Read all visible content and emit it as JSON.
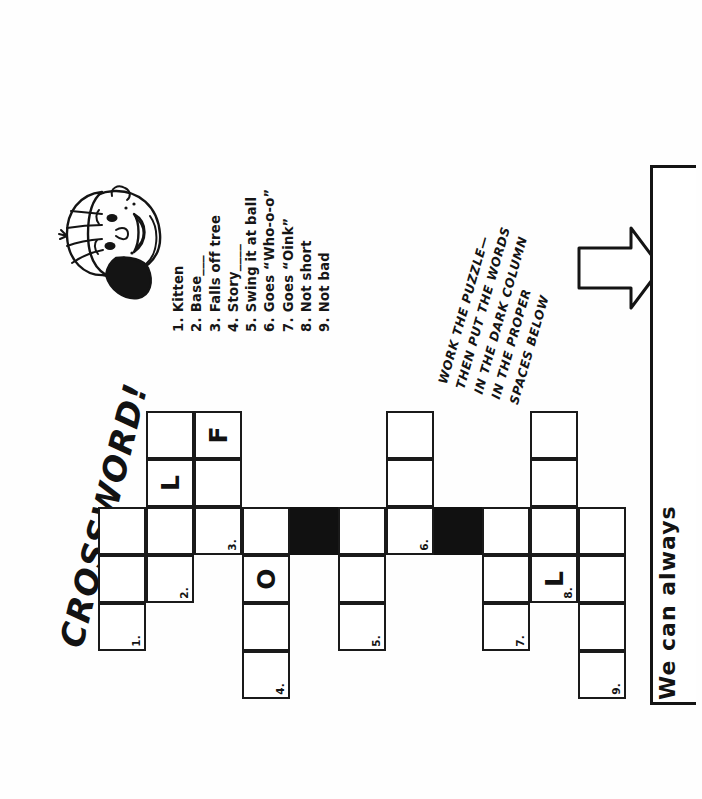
{
  "page": {
    "title": "CROSSWORD!",
    "orientation": "rotated-90-ccw",
    "background_color": "#ffffff",
    "ink_color": "#141414"
  },
  "mascot": {
    "name": "boy-wearing-baseball-cap",
    "description": "cartoon face of a smiling boy wearing a striped baseball cap"
  },
  "clues": {
    "items": [
      {
        "num": "1.",
        "text": "Kitten"
      },
      {
        "num": "2.",
        "text": "Base___"
      },
      {
        "num": "3.",
        "text": "Falls off tree"
      },
      {
        "num": "4.",
        "text": "Story____"
      },
      {
        "num": "5.",
        "text": "Swing it at ball"
      },
      {
        "num": "6.",
        "text": "Goes “Who-o-o”"
      },
      {
        "num": "7.",
        "text": "Goes “Oink”"
      },
      {
        "num": "8.",
        "text": "Not short"
      },
      {
        "num": "9.",
        "text": "Not bad"
      }
    ]
  },
  "instructions": {
    "lines": [
      "WORK THE PUZZLE—",
      "THEN PUT THE WORDS",
      "IN THE DARK COLUMN",
      "IN THE PROPER",
      "SPACES BELOW"
    ]
  },
  "arrow": {
    "name": "right-pointing-arrow",
    "direction": "right"
  },
  "answer_area": {
    "prompt": "We can always",
    "blank_line_value": ""
  },
  "chart_data": {
    "type": "table",
    "note": "Grid drawn in the rotated coordinate frame of the scan. Rows/cols here are given as on-screen pixel boxes.",
    "dark_row": {
      "label": "dark column (highlighted answer strip)",
      "color": "#111111"
    },
    "prefilled_letters": [
      {
        "clue": "3",
        "letter": "F"
      },
      {
        "clue": "3",
        "letter": "L"
      },
      {
        "clue": "4",
        "letter": "O"
      },
      {
        "clue": "8",
        "letter": "L"
      }
    ],
    "cells": [
      {
        "x": 98,
        "y": 507,
        "w": 48,
        "h": 48,
        "dark": false,
        "num": "",
        "letter": ""
      },
      {
        "x": 146,
        "y": 507,
        "w": 48,
        "h": 48,
        "dark": false,
        "num": "",
        "letter": ""
      },
      {
        "x": 194,
        "y": 507,
        "w": 48,
        "h": 48,
        "dark": false,
        "num": "3.",
        "letter": ""
      },
      {
        "x": 242,
        "y": 507,
        "w": 48,
        "h": 48,
        "dark": false,
        "num": "",
        "letter": ""
      },
      {
        "x": 290,
        "y": 507,
        "w": 48,
        "h": 48,
        "dark": true,
        "num": "",
        "letter": ""
      },
      {
        "x": 338,
        "y": 507,
        "w": 48,
        "h": 48,
        "dark": false,
        "num": "",
        "letter": ""
      },
      {
        "x": 386,
        "y": 507,
        "w": 48,
        "h": 48,
        "dark": false,
        "num": "6.",
        "letter": ""
      },
      {
        "x": 434,
        "y": 507,
        "w": 48,
        "h": 48,
        "dark": true,
        "num": "",
        "letter": ""
      },
      {
        "x": 482,
        "y": 507,
        "w": 48,
        "h": 48,
        "dark": false,
        "num": "",
        "letter": ""
      },
      {
        "x": 530,
        "y": 507,
        "w": 48,
        "h": 48,
        "dark": false,
        "num": "",
        "letter": ""
      },
      {
        "x": 578,
        "y": 507,
        "w": 48,
        "h": 48,
        "dark": false,
        "num": "",
        "letter": ""
      },
      {
        "x": 146,
        "y": 459,
        "w": 48,
        "h": 48,
        "dark": false,
        "num": "",
        "letter": "L"
      },
      {
        "x": 146,
        "y": 411,
        "w": 48,
        "h": 48,
        "dark": false,
        "num": "",
        "letter": ""
      },
      {
        "x": 194,
        "y": 459,
        "w": 48,
        "h": 48,
        "dark": false,
        "num": "",
        "letter": ""
      },
      {
        "x": 194,
        "y": 411,
        "w": 48,
        "h": 48,
        "dark": false,
        "num": "",
        "letter": "F"
      },
      {
        "x": 98,
        "y": 555,
        "w": 48,
        "h": 48,
        "dark": false,
        "num": "",
        "letter": ""
      },
      {
        "x": 98,
        "y": 603,
        "w": 48,
        "h": 48,
        "dark": false,
        "num": "1.",
        "letter": ""
      },
      {
        "x": 146,
        "y": 555,
        "w": 48,
        "h": 48,
        "dark": false,
        "num": "2.",
        "letter": ""
      },
      {
        "x": 242,
        "y": 555,
        "w": 48,
        "h": 48,
        "dark": false,
        "num": "",
        "letter": "O"
      },
      {
        "x": 242,
        "y": 603,
        "w": 48,
        "h": 48,
        "dark": false,
        "num": "",
        "letter": ""
      },
      {
        "x": 242,
        "y": 651,
        "w": 48,
        "h": 48,
        "dark": false,
        "num": "4.",
        "letter": ""
      },
      {
        "x": 338,
        "y": 555,
        "w": 48,
        "h": 48,
        "dark": false,
        "num": "",
        "letter": ""
      },
      {
        "x": 338,
        "y": 603,
        "w": 48,
        "h": 48,
        "dark": false,
        "num": "5.",
        "letter": ""
      },
      {
        "x": 386,
        "y": 459,
        "w": 48,
        "h": 48,
        "dark": false,
        "num": "",
        "letter": ""
      },
      {
        "x": 386,
        "y": 411,
        "w": 48,
        "h": 48,
        "dark": false,
        "num": "",
        "letter": ""
      },
      {
        "x": 482,
        "y": 555,
        "w": 48,
        "h": 48,
        "dark": false,
        "num": "",
        "letter": ""
      },
      {
        "x": 482,
        "y": 603,
        "w": 48,
        "h": 48,
        "dark": false,
        "num": "7.",
        "letter": ""
      },
      {
        "x": 530,
        "y": 555,
        "w": 48,
        "h": 48,
        "dark": false,
        "num": "8.",
        "letter": "L"
      },
      {
        "x": 530,
        "y": 459,
        "w": 48,
        "h": 48,
        "dark": false,
        "num": "",
        "letter": ""
      },
      {
        "x": 530,
        "y": 411,
        "w": 48,
        "h": 48,
        "dark": false,
        "num": "",
        "letter": ""
      },
      {
        "x": 578,
        "y": 555,
        "w": 48,
        "h": 48,
        "dark": false,
        "num": "",
        "letter": ""
      },
      {
        "x": 578,
        "y": 603,
        "w": 48,
        "h": 48,
        "dark": false,
        "num": "",
        "letter": ""
      },
      {
        "x": 578,
        "y": 651,
        "w": 48,
        "h": 48,
        "dark": false,
        "num": "9.",
        "letter": ""
      }
    ]
  }
}
